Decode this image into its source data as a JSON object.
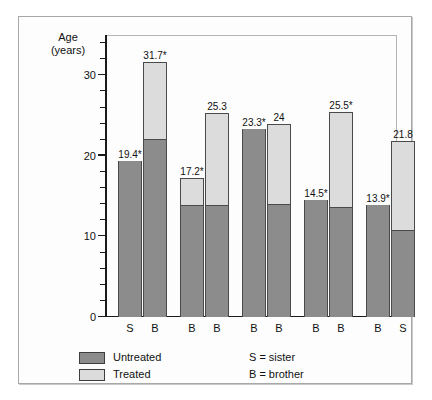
{
  "axis_title": "Age\n(years)",
  "legend": {
    "items": [
      {
        "label": "Untreated",
        "color": "#8c8c8c"
      },
      {
        "label": "Treated",
        "color": "#dcdcdc"
      }
    ],
    "keys": [
      {
        "text": "S  =  sister"
      },
      {
        "text": "B  =  brother"
      }
    ]
  },
  "chart_data": {
    "type": "bar",
    "title": "",
    "xlabel": "",
    "ylabel": "Age (years)",
    "ylim": [
      0,
      35
    ],
    "yticks": [
      0,
      10,
      20,
      30
    ],
    "ytick_labels": [
      "0",
      "10",
      "20",
      "30"
    ],
    "minor_tick_step": 2,
    "grid": false,
    "legend_position": "below-left",
    "stacked": true,
    "categories": [
      "S",
      "B",
      "B",
      "B",
      "B",
      "B",
      "B",
      "B",
      "B",
      "S"
    ],
    "groups": [
      {
        "bars": [
          0,
          1
        ]
      },
      {
        "bars": [
          2,
          3
        ]
      },
      {
        "bars": [
          4,
          5
        ]
      },
      {
        "bars": [
          6,
          7
        ]
      },
      {
        "bars": [
          8,
          9
        ]
      }
    ],
    "bars": [
      {
        "category": "S",
        "label": "19.4*",
        "total": 19.4,
        "untreated": 19.4,
        "treated": 0.0
      },
      {
        "category": "B",
        "label": "31.7*",
        "total": 31.7,
        "untreated": 22.1,
        "treated": 9.6
      },
      {
        "category": "B",
        "label": "17.2*",
        "total": 17.2,
        "untreated": 13.9,
        "treated": 3.3
      },
      {
        "category": "B",
        "label": "25.3",
        "total": 25.3,
        "untreated": 13.9,
        "treated": 11.4
      },
      {
        "category": "B",
        "label": "23.3*",
        "total": 23.3,
        "untreated": 23.3,
        "treated": 0.0
      },
      {
        "category": "B",
        "label": "24",
        "total": 24.0,
        "untreated": 14.0,
        "treated": 10.0
      },
      {
        "category": "B",
        "label": "14.5*",
        "total": 14.5,
        "untreated": 14.5,
        "treated": 0.0
      },
      {
        "category": "B",
        "label": "25.5*",
        "total": 25.5,
        "untreated": 13.7,
        "treated": 11.8
      },
      {
        "category": "B",
        "label": "13.9*",
        "total": 13.9,
        "untreated": 13.9,
        "treated": 0.0
      },
      {
        "category": "S",
        "label": "21.8",
        "total": 21.8,
        "untreated": 10.8,
        "treated": 11.0
      }
    ],
    "series": [
      {
        "name": "Untreated",
        "color": "#8c8c8c",
        "values": [
          19.4,
          22.1,
          13.9,
          13.9,
          23.3,
          14.0,
          14.5,
          13.7,
          13.9,
          10.8
        ]
      },
      {
        "name": "Treated",
        "color": "#dcdcdc",
        "values": [
          0.0,
          9.6,
          3.3,
          11.4,
          0.0,
          10.0,
          0.0,
          11.8,
          0.0,
          11.0
        ]
      }
    ],
    "annotations": [
      "* denotes significance marker on selected bars"
    ]
  }
}
